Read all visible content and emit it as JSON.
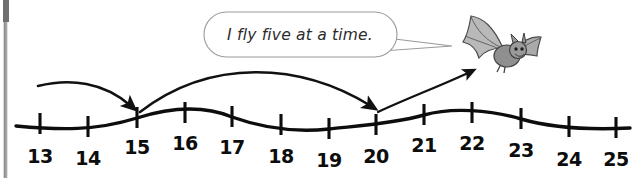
{
  "worksheet": {
    "title": "Bat skip-counting number line",
    "speech_bubble": {
      "text": "I fly five at a time.",
      "outline_color": "#9a9a9a",
      "fill_color": "#ffffff",
      "text_color": "#2b2b2b"
    },
    "character": {
      "name": "bat-illustration",
      "description": "bat",
      "color": "#7a7a7a"
    },
    "number_line": {
      "start": 13,
      "end": 25,
      "step": 1,
      "line_color": "#0d0d0d",
      "label_color": "#0d0d0d",
      "labels": [
        {
          "value": "13",
          "x": 40,
          "y": 163
        },
        {
          "value": "14",
          "x": 88,
          "y": 165
        },
        {
          "value": "15",
          "x": 137,
          "y": 154
        },
        {
          "value": "16",
          "x": 185,
          "y": 150
        },
        {
          "value": "17",
          "x": 232,
          "y": 154
        },
        {
          "value": "18",
          "x": 281,
          "y": 163
        },
        {
          "value": "19",
          "x": 329,
          "y": 167
        },
        {
          "value": "20",
          "x": 376,
          "y": 163
        },
        {
          "value": "21",
          "x": 424,
          "y": 152
        },
        {
          "value": "22",
          "x": 472,
          "y": 150
        },
        {
          "value": "23",
          "x": 521,
          "y": 157
        },
        {
          "value": "24",
          "x": 569,
          "y": 166
        },
        {
          "value": "25",
          "x": 616,
          "y": 166
        }
      ],
      "ticks": [
        {
          "value": "13",
          "x": 40,
          "y": 124
        },
        {
          "value": "14",
          "x": 88,
          "y": 127
        },
        {
          "value": "15",
          "x": 137,
          "y": 118
        },
        {
          "value": "16",
          "x": 185,
          "y": 113
        },
        {
          "value": "17",
          "x": 232,
          "y": 117
        },
        {
          "value": "18",
          "x": 281,
          "y": 125
        },
        {
          "value": "19",
          "x": 329,
          "y": 129
        },
        {
          "value": "20",
          "x": 376,
          "y": 125
        },
        {
          "value": "21",
          "x": 424,
          "y": 115
        },
        {
          "value": "22",
          "x": 472,
          "y": 113
        },
        {
          "value": "23",
          "x": 521,
          "y": 119
        },
        {
          "value": "24",
          "x": 569,
          "y": 127
        },
        {
          "value": "25",
          "x": 616,
          "y": 128
        }
      ]
    },
    "jumps": [
      {
        "name": "jump-13-to-15",
        "from": "13",
        "to": "15"
      },
      {
        "name": "jump-15-to-20",
        "from": "15",
        "to": "20"
      },
      {
        "name": "jump-20-to-bat",
        "from": "20",
        "to": "bat"
      }
    ]
  }
}
